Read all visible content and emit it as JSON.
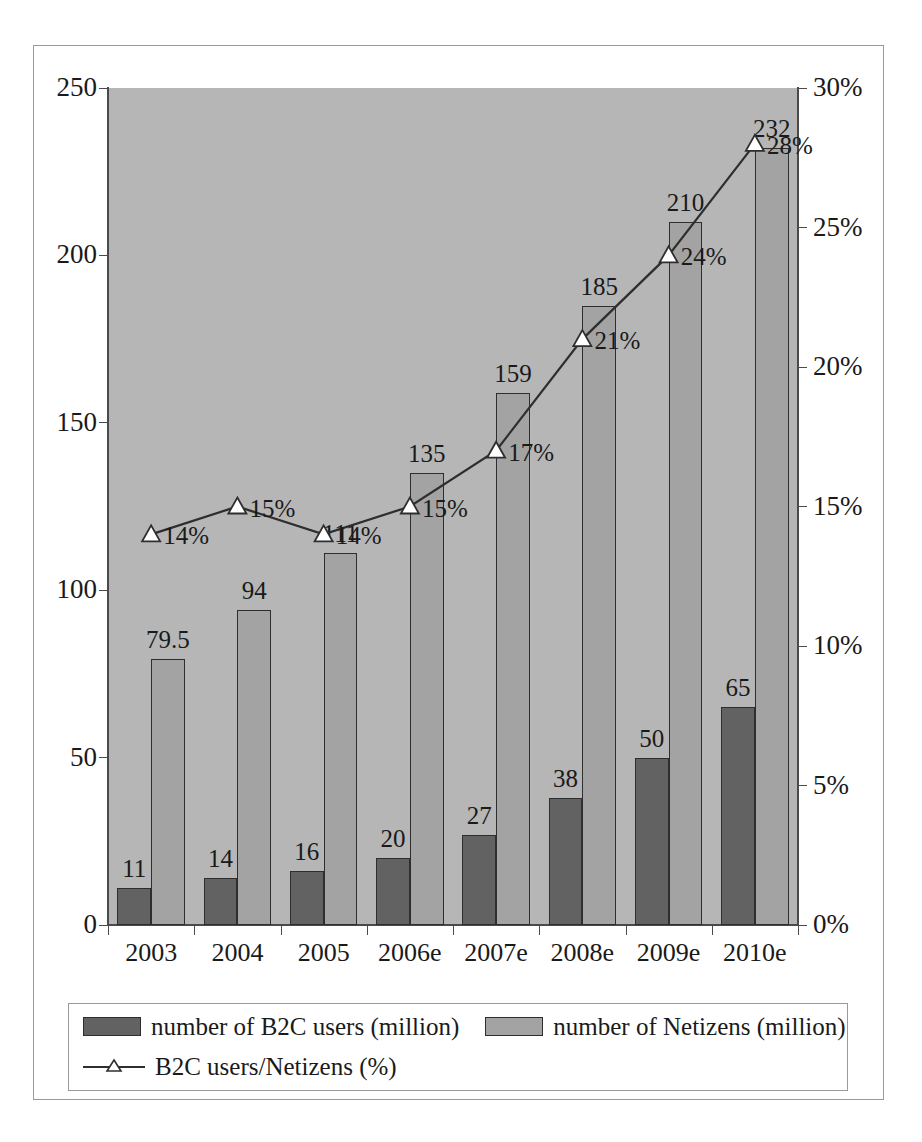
{
  "chart_data": {
    "type": "bar",
    "title": "",
    "subtitle": "",
    "xlabel": "",
    "ylabel": "",
    "y2label": "",
    "grid": false,
    "legend_position": "bottom",
    "categories": [
      "2003",
      "2004",
      "2005",
      "2006e",
      "2007e",
      "2008e",
      "2009e",
      "2010e"
    ],
    "ylim": [
      0,
      250
    ],
    "y_ticks": [
      "0",
      "50",
      "100",
      "150",
      "200",
      "250"
    ],
    "y_tick_values": [
      0,
      50,
      100,
      150,
      200,
      250
    ],
    "y2lim": [
      0,
      30
    ],
    "y2_ticks": [
      "0%",
      "5%",
      "10%",
      "15%",
      "20%",
      "25%",
      "30%"
    ],
    "y2_tick_values": [
      0,
      5,
      10,
      15,
      20,
      25,
      30
    ],
    "series": [
      {
        "name": "number of B2C users (million)",
        "type": "bar",
        "axis": "left",
        "color": "#626262",
        "values": [
          11,
          14,
          16,
          20,
          27,
          38,
          50,
          65
        ],
        "labels": [
          "11",
          "14",
          "16",
          "20",
          "27",
          "38",
          "50",
          "65"
        ]
      },
      {
        "name": "number of Netizens (million)",
        "type": "bar",
        "axis": "left",
        "color": "#a3a3a3",
        "values": [
          79.5,
          94,
          111,
          135,
          159,
          185,
          210,
          232
        ],
        "labels": [
          "79.5",
          "94",
          "111",
          "135",
          "159",
          "185",
          "210",
          "232"
        ]
      },
      {
        "name": "B2C users/Netizens (%)",
        "type": "line",
        "axis": "right",
        "color": "#2e2e2e",
        "marker": "triangle-up-hollow",
        "values": [
          14,
          15,
          14,
          15,
          17,
          21,
          24,
          28
        ],
        "labels": [
          "14%",
          "15%",
          "14%",
          "15%",
          "17%",
          "21%",
          "24%",
          "28%"
        ]
      }
    ]
  },
  "legend": {
    "items": [
      {
        "label": "number of B2C users (million)",
        "marker": "swatch-dark"
      },
      {
        "label": "number of Netizens (million)",
        "marker": "swatch-light"
      },
      {
        "label": "B2C users/Netizens (%)",
        "marker": "line-triangle"
      }
    ]
  },
  "colors": {
    "plot_background": "#b6b6b6",
    "page_background": "#ffffff",
    "bar_b2c": "#626262",
    "bar_netizens": "#a3a3a3",
    "line": "#2e2e2e",
    "axis": "#4a4a4a",
    "frame": "#9a9a9a",
    "text": "#1a1a1a"
  }
}
